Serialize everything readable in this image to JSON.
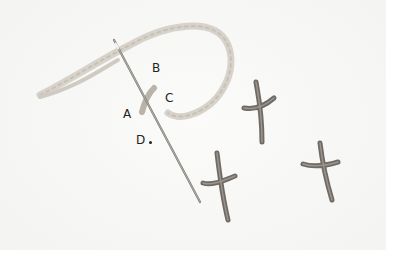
{
  "image": {
    "description": "Embroidery demonstration photo: needle threaded with light thread piercing fabric, with point labels and three finished cross stitches",
    "colors": {
      "fabric": "#f6f6f5",
      "thread_light": "#cfcac0",
      "stitch_dark": "#6f6a64",
      "needle": "#8a8580",
      "label_text": "#222222"
    }
  },
  "labels": {
    "a": "A",
    "b": "B",
    "c": "C",
    "d": "D"
  }
}
